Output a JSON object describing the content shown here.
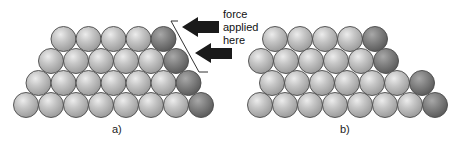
{
  "panels": [
    {
      "id": "a",
      "label": "a)",
      "label_pos": [
        112,
        123
      ],
      "rows": [
        {
          "cy": 39,
          "start_cx": 63.5,
          "count": 5,
          "dark_last": 1
        },
        {
          "cy": 61,
          "start_cx": 51,
          "count": 6,
          "dark_last": 1
        },
        {
          "cy": 83,
          "start_cx": 38.5,
          "count": 7,
          "dark_last": 1
        },
        {
          "cy": 105,
          "start_cx": 26,
          "count": 8,
          "dark_last": 1
        }
      ]
    },
    {
      "id": "b",
      "label": "b)",
      "label_pos": [
        340,
        123
      ],
      "rows": [
        {
          "cy": 39,
          "start_cx": 275,
          "count": 5,
          "dark_last": 1
        },
        {
          "cy": 61,
          "start_cx": 261,
          "count": 6,
          "dark_last": 1
        },
        {
          "cy": 83,
          "start_cx": 272,
          "count": 7,
          "dark_last": 1
        },
        {
          "cy": 105,
          "start_cx": 260,
          "count": 8,
          "dark_last": 1
        }
      ]
    }
  ],
  "sphere": {
    "radius": 12.5,
    "spacing": 25
  },
  "annotation": {
    "lines": [
      "force",
      "applied",
      "here"
    ]
  },
  "colors": {
    "light_fill": "#bdbdbd",
    "light_highlight": "#e6e6e6",
    "dark_fill": "#7c7c7c",
    "dark_highlight": "#a4a4a4",
    "outline": "#4a4a4a",
    "arrow": "#1a1a1a"
  }
}
